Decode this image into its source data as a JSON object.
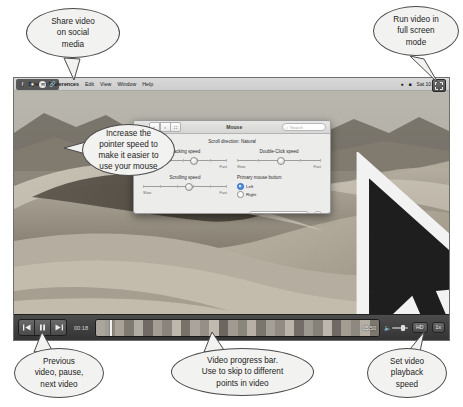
{
  "callouts": {
    "share": [
      "Share video",
      "on social",
      "media"
    ],
    "fullscreen": [
      "Run video in",
      "full screen",
      "mode"
    ],
    "pointer": [
      "Increase the",
      "pointer speed to",
      "make it easier to",
      "use your mouse"
    ],
    "transport": [
      "Previous",
      "video, pause,",
      "next video"
    ],
    "progress": [
      "Video progress bar.",
      "Use to skip to different",
      "points in video"
    ],
    "speed": [
      "Set video",
      "playback",
      "speed"
    ]
  },
  "menubar": {
    "apple_icon": "apple-logo-icon",
    "items": [
      {
        "label": "System Preferences",
        "bold": true
      },
      {
        "label": "Edit",
        "bold": false
      },
      {
        "label": "View",
        "bold": false
      },
      {
        "label": "Window",
        "bold": false
      },
      {
        "label": "Help",
        "bold": false
      }
    ],
    "status_items": [
      "Sat 10:44"
    ],
    "status_icons": [
      "wifi-icon",
      "battery-icon",
      "search-icon"
    ]
  },
  "share_overlay": {
    "icons": [
      "facebook-icon",
      "twitter-icon",
      "email-icon",
      "link-icon"
    ]
  },
  "fullscreen_button": {
    "icon": "expand-arrows-icon"
  },
  "sysprefs": {
    "title": "Mouse",
    "grid_icon": "grid-view-icon",
    "back_icon": "‹",
    "forward_icon": "›",
    "all_icon": "∷",
    "search_placeholder": "Search",
    "search_icon": "search-icon",
    "scroll_direction": "Scroll direction: Natural",
    "fields": [
      {
        "label": "Tracking speed",
        "left_end": "Slow",
        "right_end": "Fast",
        "knob_pct": 60
      },
      {
        "label": "Double-Click speed",
        "left_end": "Slow",
        "right_end": "Fast",
        "knob_pct": 52
      },
      {
        "label": "Scrolling speed",
        "left_end": "Slow",
        "right_end": "Fast",
        "knob_pct": 55
      }
    ],
    "primary_button_label": "Primary mouse button:",
    "radios": [
      {
        "label": "Left",
        "selected": true
      },
      {
        "label": "Right",
        "selected": false
      }
    ],
    "setup_button": "Set Up Bluetooth Mouse...",
    "help_button": "?"
  },
  "player": {
    "transport": [
      {
        "name": "previous-video-button",
        "glyph": "⧏|"
      },
      {
        "name": "pause-button",
        "glyph": "‖"
      },
      {
        "name": "next-video-button",
        "glyph": "|⧐"
      }
    ],
    "current_time": "00:18",
    "total_time": "05:50",
    "progress_pct": 5,
    "volume_icon": "volume-icon",
    "quality_label": "HD",
    "speed_label": "1x"
  }
}
